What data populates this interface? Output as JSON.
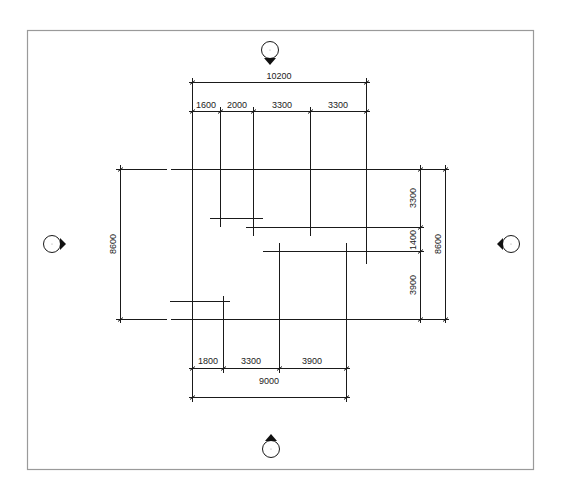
{
  "drawing": {
    "type": "structural-grid-plan",
    "line_color": "#1a1a1a",
    "frame_color": "#8a8a8a",
    "top_dimensions": {
      "overall": "10200",
      "segments": [
        "1600",
        "2000",
        "3300",
        "3300"
      ]
    },
    "bottom_dimensions": {
      "segments": [
        "1800",
        "3300",
        "3900"
      ],
      "overall": "9000"
    },
    "left_dimensions": {
      "overall": "8600"
    },
    "right_dimensions": {
      "segments": [
        "3300",
        "1400",
        "3900"
      ],
      "overall": "8600"
    },
    "direction_markers": [
      {
        "position": "top",
        "pointer": "down"
      },
      {
        "position": "left",
        "pointer": "right"
      },
      {
        "position": "right",
        "pointer": "left"
      },
      {
        "position": "bottom",
        "pointer": "up"
      }
    ]
  }
}
